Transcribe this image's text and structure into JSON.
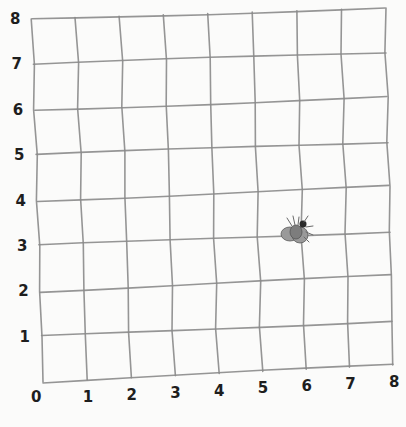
{
  "grid": {
    "x_labels": [
      "0",
      "1",
      "2",
      "3",
      "4",
      "5",
      "6",
      "7",
      "8"
    ],
    "y_labels": [
      "1",
      "2",
      "3",
      "4",
      "5",
      "6",
      "7",
      "8"
    ],
    "x_min": 0,
    "x_max": 8,
    "y_min": 0,
    "y_max": 8,
    "corners": {
      "top_left": [
        32,
        19
      ],
      "top_right": [
        385,
        8
      ],
      "bottom_left": [
        43,
        382
      ],
      "bottom_right": [
        393,
        365
      ]
    },
    "line_color": "#8a8a8a",
    "label_color": "#1e1e1e"
  },
  "fly": {
    "description": "fly",
    "grid_position": [
      6,
      3.3
    ],
    "pixel_center": [
      296,
      232
    ]
  }
}
